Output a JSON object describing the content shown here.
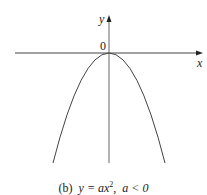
{
  "figure": {
    "axis_labels": {
      "x": "x",
      "y": "y",
      "origin": "0"
    },
    "curve": "y = ax^2, a < 0 (downward-opening parabola, vertex at origin)",
    "caption": {
      "prefix": "(b)",
      "equation": "y = ax",
      "exponent": "2",
      "separator": ",",
      "condition": "a < 0"
    },
    "colors": {
      "stroke": "#444444",
      "text": "#222222"
    }
  }
}
